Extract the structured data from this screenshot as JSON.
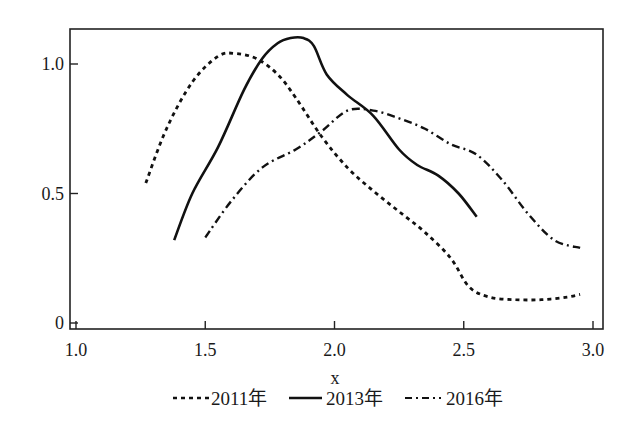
{
  "chart_data": {
    "type": "line",
    "title": "",
    "xlabel": "x",
    "ylabel": "",
    "xlim": [
      1.0,
      3.0
    ],
    "ylim": [
      0,
      1.1
    ],
    "grid": false,
    "legend_position": "bottom",
    "x_ticks": [
      "1.0",
      "1.5",
      "2.0",
      "2.5",
      "3.0"
    ],
    "y_ticks": [
      "0",
      "0.5",
      "1.0"
    ],
    "series": [
      {
        "name": "2011年",
        "style": "dashed",
        "x": [
          1.27,
          1.35,
          1.45,
          1.55,
          1.62,
          1.7,
          1.78,
          1.85,
          1.95,
          2.05,
          2.15,
          2.25,
          2.35,
          2.45,
          2.52,
          2.6,
          2.7,
          2.8,
          2.9,
          2.95
        ],
        "y": [
          0.54,
          0.75,
          0.93,
          1.03,
          1.04,
          1.02,
          0.96,
          0.87,
          0.72,
          0.6,
          0.51,
          0.43,
          0.35,
          0.25,
          0.14,
          0.1,
          0.09,
          0.09,
          0.1,
          0.11
        ]
      },
      {
        "name": "2013年",
        "style": "solid",
        "x": [
          1.38,
          1.45,
          1.55,
          1.65,
          1.72,
          1.78,
          1.83,
          1.88,
          1.92,
          1.97,
          2.05,
          2.15,
          2.25,
          2.32,
          2.4,
          2.48,
          2.55
        ],
        "y": [
          0.32,
          0.5,
          0.68,
          0.9,
          1.02,
          1.08,
          1.1,
          1.1,
          1.07,
          0.96,
          0.88,
          0.8,
          0.67,
          0.61,
          0.57,
          0.5,
          0.41
        ]
      },
      {
        "name": "2016年",
        "style": "dashdot",
        "x": [
          1.5,
          1.6,
          1.72,
          1.85,
          1.95,
          2.05,
          2.15,
          2.25,
          2.35,
          2.45,
          2.55,
          2.65,
          2.75,
          2.85,
          2.95
        ],
        "y": [
          0.33,
          0.47,
          0.6,
          0.67,
          0.74,
          0.82,
          0.82,
          0.79,
          0.75,
          0.69,
          0.65,
          0.55,
          0.42,
          0.32,
          0.29
        ]
      }
    ]
  },
  "legend": {
    "items": [
      "2011年",
      "2013年",
      "2016年"
    ]
  }
}
